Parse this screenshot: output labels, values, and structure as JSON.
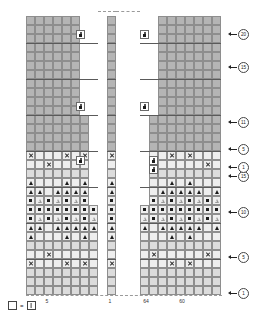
{
  "chart_data": {
    "type": "table",
    "cell_size": 9,
    "panels": [
      {
        "name": "left-panel",
        "x": 26,
        "bottom_y": 295,
        "columns": 8,
        "rows": 31,
        "stitch_labels": [
          "5"
        ],
        "steps": [
          {
            "row_from": 1,
            "row_to": 10,
            "columns": 8
          },
          {
            "row_from": 11,
            "row_to": 20,
            "columns": 7
          },
          {
            "row_from": 21,
            "row_to": 31,
            "columns": 6
          }
        ]
      },
      {
        "name": "center-panel",
        "x": 107,
        "bottom_y": 295,
        "columns": 1,
        "rows": 31,
        "stitch_labels": [
          "1"
        ]
      },
      {
        "name": "right-panel",
        "x": 140,
        "bottom_y": 295,
        "columns": 9,
        "rows": 31,
        "stitch_labels": [
          "64",
          "60"
        ],
        "steps": [
          {
            "row_from": 1,
            "row_to": 10,
            "columns": 9
          },
          {
            "row_from": 11,
            "row_to": 20,
            "columns": 8
          },
          {
            "row_from": 21,
            "row_to": 31,
            "columns": 7
          }
        ]
      }
    ],
    "row_markers": [
      {
        "label": "1",
        "y": 290
      },
      {
        "label": "5",
        "y": 254
      },
      {
        "label": "10",
        "y": 209
      },
      {
        "label": "15",
        "y": 173
      },
      {
        "label": "1",
        "y": 164
      },
      {
        "label": "5",
        "y": 146
      },
      {
        "label": "11",
        "y": 119
      },
      {
        "label": "15",
        "y": 64
      },
      {
        "label": "20",
        "y": 31
      }
    ],
    "column_labels": [
      {
        "label": "5",
        "x": 47,
        "y": 298
      },
      {
        "label": "1",
        "x": 110,
        "y": 298
      },
      {
        "label": "64",
        "x": 146,
        "y": 298
      },
      {
        "label": "60",
        "x": 182,
        "y": 298
      }
    ],
    "symbols": {
      "knit": {
        "name": "empty-square",
        "glyph": ""
      },
      "purl": {
        "name": "dot",
        "glyph": "•"
      },
      "yarn_over": {
        "name": "x-mark",
        "glyph": "×"
      },
      "dec_filled": {
        "name": "filled-triangle",
        "glyph": "▲"
      },
      "dec_open": {
        "name": "open-triangle",
        "glyph": "△"
      },
      "marker": {
        "name": "figure-marker",
        "glyph": "♟"
      }
    },
    "symbol_rows": {
      "note": "Rows 1-16 of lower band carry pattern symbols; rows above are plain shaded cells.",
      "pattern": [
        {
          "row": 16,
          "type": "x-alt-a"
        },
        {
          "row": 15,
          "type": "x-alt-b"
        },
        {
          "row": 14,
          "type": "plain"
        },
        {
          "row": 13,
          "type": "tri-single"
        },
        {
          "row": 12,
          "type": "tri-triple"
        },
        {
          "row": 11,
          "type": "dot-open-alt"
        },
        {
          "row": 10,
          "type": "open-dot-alt"
        },
        {
          "row": 9,
          "type": "dot-open-alt"
        },
        {
          "row": 8,
          "type": "tri-triple"
        },
        {
          "row": 7,
          "type": "tri-single"
        },
        {
          "row": 6,
          "type": "plain"
        },
        {
          "row": 5,
          "type": "x-alt-b"
        },
        {
          "row": 4,
          "type": "x-alt-a"
        },
        {
          "row": 3,
          "type": "plain"
        },
        {
          "row": 2,
          "type": "plain"
        },
        {
          "row": 1,
          "type": "plain"
        }
      ]
    },
    "legend": {
      "left_symbol": "empty-square",
      "equals": "=",
      "right_symbol": "knit-stitch-square",
      "text": "="
    },
    "colors": {
      "cell_fill": "#b5b5b5",
      "symbol_cell_fill": "#eeeeee",
      "grid_line": "#8e8e8e",
      "heavy_line": "#5a5a5a",
      "symbol_ink": "#1c1c1c",
      "background": "#ffffff"
    }
  },
  "legend": {
    "equals": "="
  }
}
